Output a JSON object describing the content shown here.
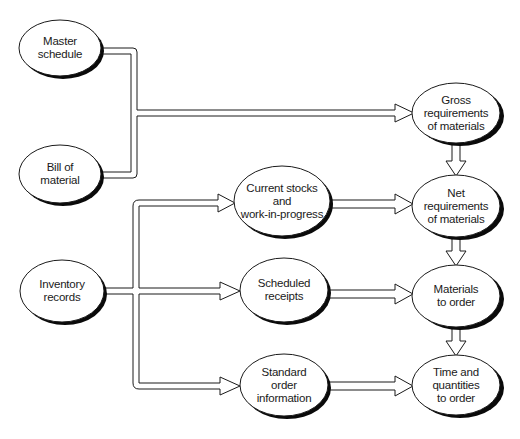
{
  "diagram": {
    "type": "flowchart",
    "style": {
      "stroke": "#1a1a1a",
      "fill": "#ffffff",
      "shadow": "#0a0a0a",
      "background": "#ffffff"
    },
    "nodes": [
      {
        "id": "master_schedule",
        "label": "Master\nschedule",
        "cx": 60,
        "cy": 48,
        "rx": 41,
        "ry": 28
      },
      {
        "id": "bill_of_material",
        "label": "Bill of\nmaterial",
        "cx": 60,
        "cy": 174,
        "rx": 41,
        "ry": 29
      },
      {
        "id": "inventory_records",
        "label": "Inventory\nrecords",
        "cx": 62,
        "cy": 291,
        "rx": 42,
        "ry": 31
      },
      {
        "id": "current_stocks",
        "label": "Current stocks\nand\nwork-in-progress",
        "cx": 282,
        "cy": 201,
        "rx": 48,
        "ry": 35
      },
      {
        "id": "scheduled_receipts",
        "label": "Scheduled\nreceipts",
        "cx": 284,
        "cy": 290,
        "rx": 44,
        "ry": 32
      },
      {
        "id": "standard_order_info",
        "label": "Standard\norder\ninformation",
        "cx": 284,
        "cy": 385,
        "rx": 44,
        "ry": 31
      },
      {
        "id": "gross_requirements",
        "label": "Gross\nrequirements\nof materials",
        "cx": 456,
        "cy": 113,
        "rx": 44,
        "ry": 30
      },
      {
        "id": "net_requirements",
        "label": "Net\nrequirements\nof materials",
        "cx": 456,
        "cy": 206,
        "rx": 44,
        "ry": 31
      },
      {
        "id": "materials_to_order",
        "label": "Materials\nto order",
        "cx": 456,
        "cy": 296,
        "rx": 44,
        "ry": 31
      },
      {
        "id": "time_and_quantities",
        "label": "Time and\nquantities\nto order",
        "cx": 456,
        "cy": 385,
        "rx": 44,
        "ry": 30
      }
    ],
    "edges": [
      {
        "from": "master_schedule",
        "to": "gross_requirements"
      },
      {
        "from": "bill_of_material",
        "to": "gross_requirements"
      },
      {
        "from": "inventory_records",
        "to": "current_stocks"
      },
      {
        "from": "inventory_records",
        "to": "scheduled_receipts"
      },
      {
        "from": "inventory_records",
        "to": "standard_order_info"
      },
      {
        "from": "current_stocks",
        "to": "net_requirements"
      },
      {
        "from": "scheduled_receipts",
        "to": "materials_to_order"
      },
      {
        "from": "standard_order_info",
        "to": "time_and_quantities"
      },
      {
        "from": "gross_requirements",
        "to": "net_requirements"
      },
      {
        "from": "net_requirements",
        "to": "materials_to_order"
      },
      {
        "from": "materials_to_order",
        "to": "time_and_quantities"
      }
    ]
  }
}
